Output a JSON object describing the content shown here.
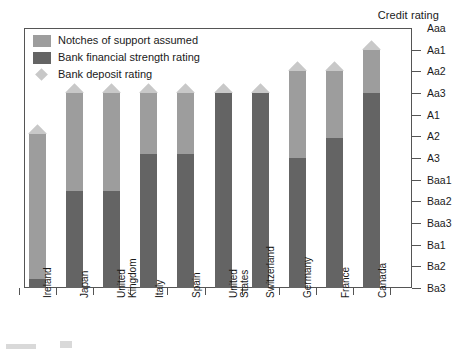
{
  "title": "Credit rating",
  "legend": {
    "items": [
      {
        "label": "Notches of support assumed",
        "icon": "square-swatch",
        "color": "#9d9d9d"
      },
      {
        "label": "Bank financial strength rating",
        "icon": "square-swatch",
        "color": "#646464"
      },
      {
        "label": "Bank deposit rating",
        "icon": "diamond-marker",
        "color": "#c8c8c8"
      }
    ]
  },
  "axis": {
    "y_label": "Credit rating",
    "y_ticks": [
      "Aaa",
      "Aa1",
      "Aa2",
      "Aa3",
      "A1",
      "A2",
      "A3",
      "Baa1",
      "Baa2",
      "Baa3",
      "Ba1",
      "Ba2",
      "Ba3"
    ]
  },
  "chart_data": {
    "type": "bar",
    "title": "Credit rating",
    "xlabel": "",
    "ylabel": "Credit rating",
    "stacked": true,
    "grid": false,
    "legend_position": "top-left",
    "categories": [
      "Ireland",
      "Japan",
      "United Kingdom",
      "Italy",
      "Spain",
      "United States",
      "Switzerland",
      "Germany",
      "France",
      "Canada"
    ],
    "y_scale_labels": [
      "Aaa",
      "Aa1",
      "Aa2",
      "Aa3",
      "A1",
      "A2",
      "A3",
      "Baa1",
      "Baa2",
      "Baa3",
      "Ba1",
      "Ba2",
      "Ba3"
    ],
    "y_scale_index": {
      "Aaa": 0,
      "Aa1": 1,
      "Aa2": 2,
      "Aa3": 3,
      "A1": 4,
      "A2": 5,
      "A3": 6,
      "Baa1": 7,
      "Baa2": 8,
      "Baa3": 9,
      "Ba1": 10,
      "Ba2": 11,
      "Ba3": 12
    },
    "series": [
      {
        "name": "Bank financial strength rating",
        "color": "#646464",
        "values": [
          "Ba2",
          "Baa2",
          "Baa2",
          "A3",
          "A3",
          "Aa3",
          "Aa3",
          "A3",
          "A2",
          "Aa3"
        ]
      },
      {
        "name": "Notches of support assumed",
        "color": "#9d9d9d",
        "values": [
          "A1",
          "Aa3",
          "Aa3",
          "Aa3",
          "Aa3",
          "Aa3",
          "Aa3",
          "Aa2",
          "Aa2",
          "Aa1"
        ]
      },
      {
        "name": "Bank deposit rating",
        "color": "#c8c8c8",
        "marker": "diamond",
        "values": [
          "A1",
          "Aa3",
          "Aa3",
          "Aa3",
          "Aa3",
          "Aa3",
          "Aa3",
          "Aa2",
          "Aa2",
          "Aa1"
        ]
      }
    ],
    "bars": [
      {
        "category": "Ireland",
        "top_rating": "A1",
        "bfsr_rating": "Ba2",
        "top_index": 4.9,
        "bfsr_index": 11.6
      },
      {
        "category": "Japan",
        "top_rating": "Aa3",
        "bfsr_rating": "Baa2",
        "top_index": 3.0,
        "bfsr_index": 7.5
      },
      {
        "category": "United Kingdom",
        "top_rating": "Aa3",
        "bfsr_rating": "Baa2",
        "top_index": 3.0,
        "bfsr_index": 7.5
      },
      {
        "category": "Italy",
        "top_rating": "Aa3",
        "bfsr_rating": "A3",
        "top_index": 3.0,
        "bfsr_index": 5.8
      },
      {
        "category": "Spain",
        "top_rating": "Aa3",
        "bfsr_rating": "A3",
        "top_index": 3.0,
        "bfsr_index": 5.8
      },
      {
        "category": "United States",
        "top_rating": "Aa3",
        "bfsr_rating": "Aa3",
        "top_index": 3.0,
        "bfsr_index": 3.0
      },
      {
        "category": "Switzerland",
        "top_rating": "Aa3",
        "bfsr_rating": "Aa3",
        "top_index": 3.0,
        "bfsr_index": 3.0
      },
      {
        "category": "Germany",
        "top_rating": "Aa2",
        "bfsr_rating": "A3",
        "top_index": 2.0,
        "bfsr_index": 6.0
      },
      {
        "category": "France",
        "top_rating": "Aa2",
        "bfsr_rating": "A2",
        "top_index": 2.0,
        "bfsr_index": 5.1
      },
      {
        "category": "Canada",
        "top_rating": "Aa1",
        "bfsr_rating": "Aa3",
        "top_index": 1.0,
        "bfsr_index": 3.0
      }
    ]
  }
}
